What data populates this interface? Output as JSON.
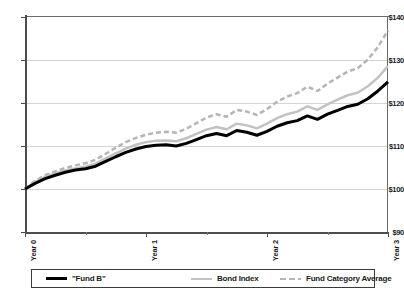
{
  "chart_data": {
    "type": "line",
    "title": "",
    "subtitle": "",
    "xlabel": "",
    "ylabel": "",
    "grid": true,
    "legend_position": "bottom",
    "ylim": [
      90,
      140
    ],
    "ytick_labels": [
      "$140",
      "$130",
      "$120",
      "$110",
      "$100",
      "$90"
    ],
    "ytick_values": [
      140,
      130,
      120,
      110,
      100,
      90
    ],
    "xlim": [
      0,
      3
    ],
    "xtick_labels": [
      "Year 0",
      "Year 1",
      "Year 2",
      "Year 3"
    ],
    "xtick_values": [
      0,
      1,
      2,
      3
    ],
    "xtick_minor_values": [
      0.5,
      1.5,
      2.5
    ],
    "x": [
      0,
      0.0833,
      0.1667,
      0.25,
      0.3333,
      0.4167,
      0.5,
      0.5833,
      0.6667,
      0.75,
      0.8333,
      0.9167,
      1.0,
      1.0833,
      1.1667,
      1.25,
      1.3333,
      1.4167,
      1.5,
      1.5833,
      1.6667,
      1.75,
      1.8333,
      1.9167,
      2.0,
      2.0833,
      2.1667,
      2.25,
      2.3333,
      2.4167,
      2.5,
      2.5833,
      2.6667,
      2.75,
      2.8333,
      2.9167,
      3.0
    ],
    "series": [
      {
        "name": "\"Fund B\"",
        "style": "solid",
        "color": "#000000",
        "width": 3,
        "values": [
          100.0,
          101.3,
          102.4,
          103.2,
          103.9,
          104.4,
          104.7,
          105.3,
          106.4,
          107.5,
          108.5,
          109.3,
          109.9,
          110.2,
          110.3,
          110.0,
          110.6,
          111.5,
          112.4,
          112.9,
          112.4,
          113.6,
          113.2,
          112.5,
          113.4,
          114.6,
          115.4,
          115.9,
          117.0,
          116.2,
          117.4,
          118.3,
          119.2,
          119.7,
          121.0,
          122.8,
          124.9
        ]
      },
      {
        "name": "Bond Index",
        "style": "solid",
        "color": "#c2c2c2",
        "width": 2.5,
        "values": [
          100.0,
          101.6,
          102.8,
          103.6,
          104.3,
          104.8,
          105.2,
          105.9,
          107.1,
          108.3,
          109.4,
          110.3,
          110.9,
          111.2,
          111.3,
          111.1,
          111.8,
          112.8,
          113.8,
          114.4,
          113.9,
          115.2,
          114.8,
          114.1,
          115.2,
          116.5,
          117.4,
          118.0,
          119.2,
          118.4,
          119.7,
          120.8,
          121.8,
          122.4,
          123.9,
          125.9,
          128.6
        ]
      },
      {
        "name": "Fund Category Average",
        "style": "dashed",
        "color": "#b5b5b5",
        "width": 2.5,
        "values": [
          100.0,
          101.9,
          103.2,
          104.1,
          104.9,
          105.5,
          106.0,
          106.8,
          108.2,
          109.6,
          110.9,
          111.9,
          112.6,
          113.1,
          113.3,
          113.1,
          114.0,
          115.3,
          116.6,
          117.4,
          116.8,
          118.4,
          118.0,
          117.2,
          118.6,
          120.3,
          121.5,
          122.3,
          123.8,
          122.8,
          124.5,
          125.9,
          127.3,
          128.1,
          130.1,
          133.0,
          136.9
        ]
      }
    ]
  },
  "legend": {
    "items": [
      {
        "label": "\"Fund B\"",
        "swatch": "solid-black-thick"
      },
      {
        "label": "Bond Index",
        "swatch": "solid-gray"
      },
      {
        "label": "Fund Category Average",
        "swatch": "dashed-gray"
      }
    ]
  }
}
